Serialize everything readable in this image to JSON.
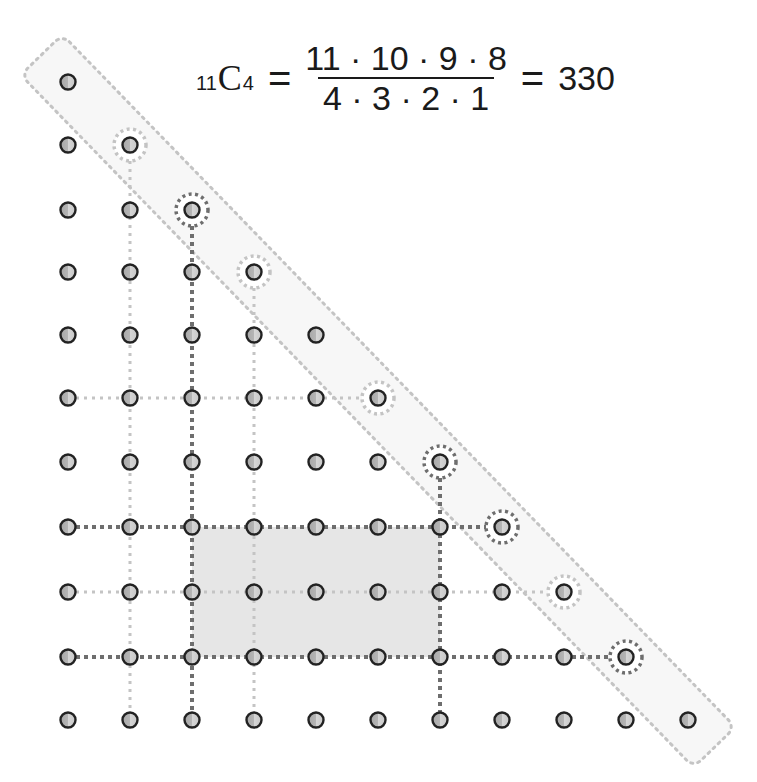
{
  "formula": {
    "n": "11",
    "C": "C",
    "r": "4",
    "equals_1": "=",
    "numerator": "11 · 10 · 9 · 8",
    "denominator": "4 · 3 · 2 · 1",
    "equals_2": "=",
    "result": "330"
  },
  "grid": {
    "columns_x": [
      68,
      130,
      192,
      254,
      316,
      378,
      440,
      502,
      564,
      626,
      688
    ],
    "rows_y": [
      82,
      145,
      210,
      272,
      335,
      398,
      462,
      527,
      592,
      657,
      720
    ],
    "shape": "lower-triangular: row i has points in columns 0..i",
    "point_count": 66
  },
  "highlighted_rect": {
    "col_from": 2,
    "col_to": 6,
    "row_from": 7,
    "row_to": 9
  },
  "diagonal_band": {
    "from": [
      0,
      0
    ],
    "to": [
      10,
      10
    ]
  },
  "circled_points": {
    "dark": [
      [
        2,
        2
      ],
      [
        6,
        6
      ],
      [
        7,
        7
      ],
      [
        9,
        9
      ]
    ],
    "light": [
      [
        1,
        1
      ],
      [
        3,
        3
      ],
      [
        5,
        5
      ],
      [
        8,
        8
      ]
    ]
  },
  "lines": {
    "dark_horizontal_rows": [
      7,
      9
    ],
    "dark_vertical_cols": [
      2,
      6
    ],
    "light_horizontal_rows": [
      5,
      8
    ],
    "light_vertical_cols": [
      1,
      3
    ]
  },
  "colors": {
    "dark_dash": "#6e6e6e",
    "light_dash": "#c4c4c4",
    "shade": "#e6e6e6",
    "dot_fill_light": "#d9d9d9",
    "dot_fill_dark": "#9c9c9c",
    "dot_stroke": "#222222",
    "text": "#1a1a1a"
  }
}
